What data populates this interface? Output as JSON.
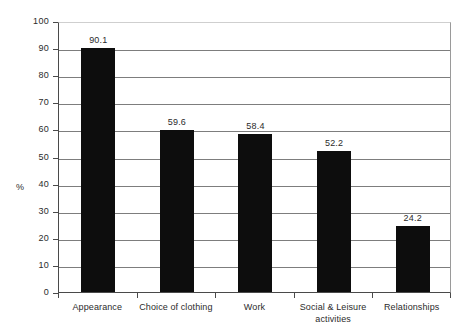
{
  "chart_data": {
    "type": "bar",
    "title": "",
    "xlabel": "",
    "ylabel": "%",
    "ylim": [
      0,
      100
    ],
    "yticks": [
      0,
      10,
      20,
      30,
      40,
      50,
      60,
      70,
      80,
      90,
      100
    ],
    "ytick_labels": [
      "0",
      "10",
      "20",
      "30",
      "40",
      "50",
      "60",
      "70",
      "80",
      "90",
      "100"
    ],
    "grid": true,
    "legend": false,
    "bar_color": "#0d0d0d",
    "grid_color": "#7d7d7d",
    "axis_color": "#4a4a4a",
    "categories": [
      "Appearance",
      "Choice of clothing",
      "Work",
      "Social & Leisure\nactivities",
      "Relationships"
    ],
    "values": [
      90.1,
      59.6,
      58.4,
      52.2,
      24.2
    ],
    "value_labels": [
      "90.1",
      "59.6",
      "58.4",
      "52.2",
      "24.2"
    ],
    "bars": [
      {
        "category": "Appearance",
        "category_line1": "Appearance",
        "category_line2": "",
        "value": 90.1,
        "label": "90.1"
      },
      {
        "category": "Choice of clothing",
        "category_line1": "Choice of clothing",
        "category_line2": "",
        "value": 59.6,
        "label": "59.6"
      },
      {
        "category": "Work",
        "category_line1": "Work",
        "category_line2": "",
        "value": 58.4,
        "label": "58.4"
      },
      {
        "category": "Social & Leisure activities",
        "category_line1": "Social & Leisure",
        "category_line2": "activities",
        "value": 52.2,
        "label": "52.2"
      },
      {
        "category": "Relationships",
        "category_line1": "Relationships",
        "category_line2": "",
        "value": 24.2,
        "label": "24.2"
      }
    ]
  }
}
